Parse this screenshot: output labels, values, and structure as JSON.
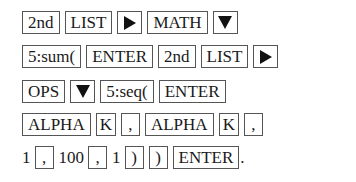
{
  "keystrokes": {
    "row1": [
      {
        "type": "key",
        "label": "2nd"
      },
      {
        "type": "key",
        "label": "LIST"
      },
      {
        "type": "icon",
        "icon": "right-arrow-key"
      },
      {
        "type": "key",
        "label": "MATH"
      },
      {
        "type": "icon",
        "icon": "down-arrow-key"
      }
    ],
    "row2": [
      {
        "type": "key",
        "label": "5:sum("
      },
      {
        "type": "key",
        "label": "ENTER"
      },
      {
        "type": "key",
        "label": "2nd"
      },
      {
        "type": "key",
        "label": "LIST"
      },
      {
        "type": "icon",
        "icon": "right-arrow-key"
      }
    ],
    "row3": [
      {
        "type": "key",
        "label": "OPS"
      },
      {
        "type": "icon",
        "icon": "down-arrow-key"
      },
      {
        "type": "key",
        "label": "5:seq("
      },
      {
        "type": "key",
        "label": "ENTER"
      }
    ],
    "row4": [
      {
        "type": "key",
        "label": "ALPHA"
      },
      {
        "type": "key",
        "label": "K"
      },
      {
        "type": "key",
        "label": ","
      },
      {
        "type": "key",
        "label": "ALPHA"
      },
      {
        "type": "key",
        "label": "K"
      },
      {
        "type": "key",
        "label": ","
      }
    ],
    "row5": [
      {
        "type": "text",
        "label": "1"
      },
      {
        "type": "key",
        "label": ","
      },
      {
        "type": "text",
        "label": "100"
      },
      {
        "type": "key",
        "label": ","
      },
      {
        "type": "text",
        "label": "1"
      },
      {
        "type": "key",
        "label": ")"
      },
      {
        "type": "key",
        "label": ")"
      },
      {
        "type": "key",
        "label": "ENTER"
      },
      {
        "type": "text",
        "label": "."
      }
    ]
  }
}
